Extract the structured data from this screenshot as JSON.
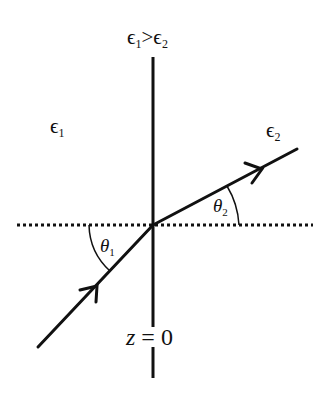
{
  "diagram": {
    "title_condition": {
      "symbol": "ϵ",
      "left_sub": "1",
      "relation": ">",
      "right_sub": "2"
    },
    "region_left": {
      "symbol": "ϵ",
      "sub": "1"
    },
    "region_right": {
      "symbol": "ϵ",
      "sub": "2"
    },
    "angle_incident": {
      "symbol": "θ",
      "sub": "1"
    },
    "angle_refracted": {
      "symbol": "θ",
      "sub": "2"
    },
    "interface_label": {
      "variable": "z",
      "equals": " = ",
      "value": "0"
    },
    "colors": {
      "stroke": "#111111",
      "background": "#ffffff"
    },
    "geometry": {
      "intersection": [
        153,
        225
      ],
      "incident_start": [
        38,
        347
      ],
      "refracted_end": [
        297,
        149
      ],
      "normal_top": 57,
      "normal_gap": [
        327,
        345
      ],
      "normal_bottom": 378,
      "dotted_line_x": [
        17,
        313
      ]
    }
  }
}
